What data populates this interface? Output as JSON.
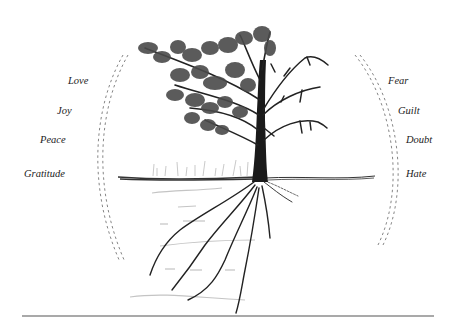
{
  "diagram": {
    "positive_emotions": [
      {
        "label": "Love",
        "x": 68,
        "y": 76
      },
      {
        "label": "Joy",
        "x": 57,
        "y": 106
      },
      {
        "label": "Peace",
        "x": 40,
        "y": 135
      },
      {
        "label": "Gratitude",
        "x": 24,
        "y": 169
      }
    ],
    "negative_emotions": [
      {
        "label": "Fear",
        "x": 388,
        "y": 76
      },
      {
        "label": "Guilt",
        "x": 398,
        "y": 106
      },
      {
        "label": "Doubt",
        "x": 406,
        "y": 135
      },
      {
        "label": "Hate",
        "x": 406,
        "y": 169
      }
    ],
    "colors": {
      "ink": "#1a1a1a",
      "foliage": "#4a4a4a",
      "dash": "#777777",
      "water": "#bdbdbd",
      "baseline": "#555555"
    }
  }
}
